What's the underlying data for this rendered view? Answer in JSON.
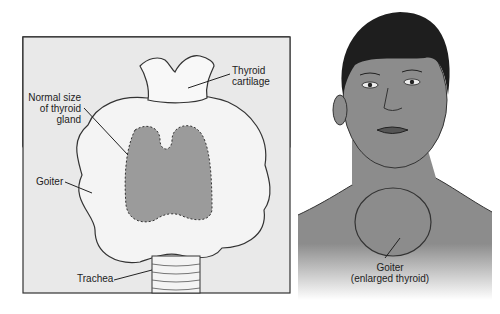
{
  "left_panel": {
    "labels": {
      "thyroid_cartilage": [
        "Thyroid",
        "cartilage"
      ],
      "normal_size": [
        "Normal size",
        "of thyroid",
        "gland"
      ],
      "goiter": "Goiter",
      "trachea": "Trachea"
    },
    "colors": {
      "background": "#e9e9e9",
      "gland_fill": "#f4f4f4",
      "normal_thyroid_fill": "#9b9b9b",
      "outline": "#333333"
    }
  },
  "right_panel": {
    "label": [
      "Goiter",
      "(enlarged thyroid)"
    ],
    "colors": {
      "skin": "#8c8c8c",
      "hair": "#1e1e1e"
    }
  }
}
